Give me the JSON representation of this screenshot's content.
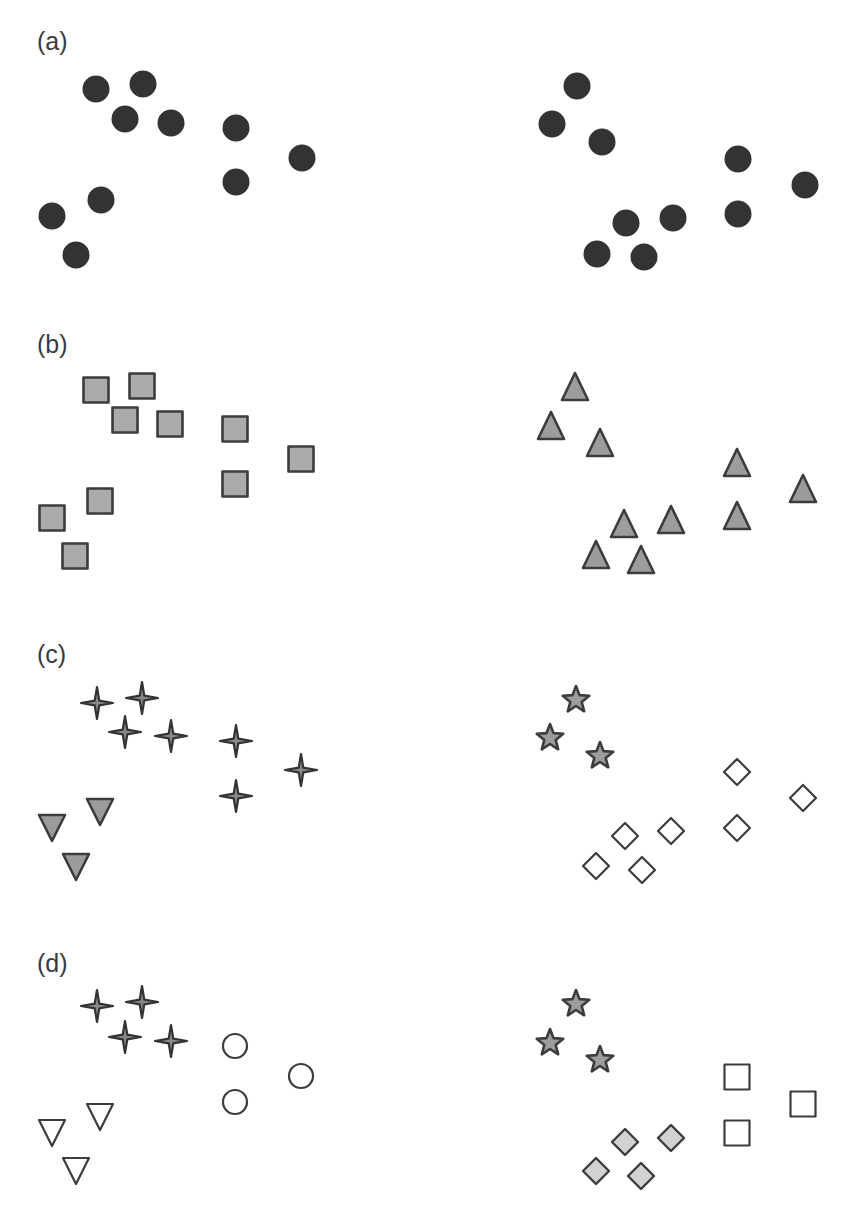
{
  "figure": {
    "width": 845,
    "height": 1215,
    "colors": {
      "dark": "#333333",
      "stroke": "#3c3c3c",
      "mid_fill": "#9c9c9c",
      "square_fill": "#ababab",
      "light_fill": "#d2d2d2",
      "open_fill": "#ffffff",
      "label": "#3a3a3a"
    },
    "panels": [
      {
        "id": "a",
        "label": "(a)",
        "label_pos": [
          37,
          50
        ],
        "groups": [
          {
            "name": "left-cluster-circles",
            "shape": "circle",
            "style": "dark-filled",
            "points": [
              [
                96,
                89
              ],
              [
                143,
                84
              ],
              [
                125,
                119
              ],
              [
                171,
                123
              ],
              [
                236,
                128
              ],
              [
                302,
                158
              ],
              [
                236,
                182
              ],
              [
                101,
                200
              ],
              [
                52,
                216
              ],
              [
                76,
                255
              ]
            ]
          },
          {
            "name": "right-cluster-circles",
            "shape": "circle",
            "style": "dark-filled",
            "points": [
              [
                577,
                86
              ],
              [
                552,
                124
              ],
              [
                602,
                142
              ],
              [
                738,
                159
              ],
              [
                805,
                185
              ],
              [
                626,
                223
              ],
              [
                673,
                218
              ],
              [
                738,
                214
              ],
              [
                597,
                254
              ],
              [
                644,
                257
              ]
            ]
          }
        ]
      },
      {
        "id": "b",
        "label": "(b)",
        "label_pos": [
          37,
          353
        ],
        "groups": [
          {
            "name": "left-cluster-squares",
            "shape": "square",
            "style": "gray-filled",
            "points": [
              [
                96,
                390
              ],
              [
                142,
                386
              ],
              [
                125,
                420
              ],
              [
                170,
                424
              ],
              [
                235,
                429
              ],
              [
                301,
                459
              ],
              [
                235,
                484
              ],
              [
                100,
                501
              ],
              [
                52,
                518
              ],
              [
                75,
                556
              ]
            ]
          },
          {
            "name": "right-cluster-triangles",
            "shape": "triangle-up",
            "style": "mid-filled",
            "points": [
              [
                575,
                388
              ],
              [
                551,
                427
              ],
              [
                600,
                444
              ],
              [
                737,
                464
              ],
              [
                803,
                490
              ],
              [
                624,
                525
              ],
              [
                671,
                521
              ],
              [
                737,
                517
              ],
              [
                596,
                556
              ],
              [
                641,
                561
              ]
            ]
          }
        ]
      },
      {
        "id": "c",
        "label": "(c)",
        "label_pos": [
          37,
          663
        ],
        "groups": [
          {
            "name": "left-cluster-4pt-stars",
            "shape": "star4",
            "style": "dark-star",
            "points": [
              [
                97,
                703
              ],
              [
                142,
                698
              ],
              [
                125,
                732
              ],
              [
                171,
                736
              ],
              [
                236,
                741
              ],
              [
                301,
                770
              ],
              [
                236,
                796
              ]
            ]
          },
          {
            "name": "left-cluster-down-triangles",
            "shape": "triangle-down",
            "style": "mid-filled",
            "points": [
              [
                100,
                811
              ],
              [
                52,
                827
              ],
              [
                76,
                866
              ]
            ]
          },
          {
            "name": "right-cluster-5pt-stars",
            "shape": "star5",
            "style": "mid-filled",
            "points": [
              [
                576,
                700
              ],
              [
                550,
                738
              ],
              [
                600,
                756
              ]
            ]
          },
          {
            "name": "right-cluster-open-diamonds",
            "shape": "diamond",
            "style": "open",
            "points": [
              [
                737,
                772
              ],
              [
                803,
                798
              ],
              [
                625,
                836
              ],
              [
                671,
                831
              ],
              [
                737,
                828
              ],
              [
                596,
                866
              ],
              [
                642,
                870
              ]
            ]
          }
        ]
      },
      {
        "id": "d",
        "label": "(d)",
        "label_pos": [
          37,
          972
        ],
        "groups": [
          {
            "name": "left-cluster-4pt-stars",
            "shape": "star4",
            "style": "dark-star",
            "points": [
              [
                97,
                1006
              ],
              [
                142,
                1002
              ],
              [
                125,
                1037
              ],
              [
                171,
                1041
              ]
            ]
          },
          {
            "name": "left-cluster-open-circles",
            "shape": "circle",
            "style": "open",
            "points": [
              [
                235,
                1046
              ],
              [
                301,
                1076
              ],
              [
                235,
                1102
              ]
            ]
          },
          {
            "name": "left-cluster-open-down-triangles",
            "shape": "triangle-down",
            "style": "open",
            "points": [
              [
                100,
                1116
              ],
              [
                52,
                1132
              ],
              [
                76,
                1170
              ]
            ]
          },
          {
            "name": "right-cluster-5pt-stars",
            "shape": "star5",
            "style": "mid-filled",
            "points": [
              [
                576,
                1004
              ],
              [
                550,
                1043
              ],
              [
                600,
                1060
              ]
            ]
          },
          {
            "name": "right-cluster-open-squares",
            "shape": "square",
            "style": "open",
            "points": [
              [
                737,
                1077
              ],
              [
                803,
                1104
              ],
              [
                737,
                1133
              ]
            ]
          },
          {
            "name": "right-cluster-light-diamonds",
            "shape": "diamond",
            "style": "light-filled",
            "points": [
              [
                625,
                1142
              ],
              [
                671,
                1138
              ],
              [
                596,
                1171
              ],
              [
                641,
                1176
              ]
            ]
          }
        ]
      }
    ]
  }
}
